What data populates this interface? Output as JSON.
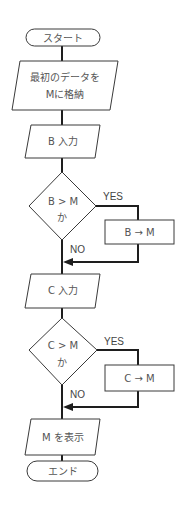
{
  "flowchart": {
    "start": "スタート",
    "store_line1": "最初のデータを",
    "store_line2": "Mに格納",
    "input_b": "B 入力",
    "decision_b_line1": "B > M",
    "decision_b_line2": "か",
    "assign_b": "B → M",
    "input_c": "C 入力",
    "decision_c_line1": "C > M",
    "decision_c_line2": "か",
    "assign_c": "C → M",
    "display": "M を表示",
    "end": "エンド",
    "yes_label": "YES",
    "no_label": "NO"
  }
}
